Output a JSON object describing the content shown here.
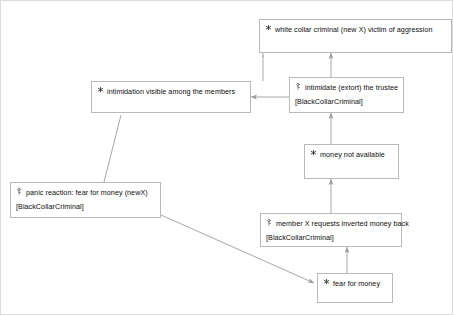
{
  "diagram": {
    "background_color": "#ffffff",
    "node_border_color": "#b9b9b9",
    "edge_color": "#a8a8a8",
    "nodes": [
      {
        "id": "victim",
        "icon": "agent-asterisk-icon",
        "label": "white collar criminal (new X) victim of aggression",
        "sub": ""
      },
      {
        "id": "intimidation-visible",
        "icon": "agent-asterisk-icon",
        "label": "intimidation visible among the members",
        "sub": ""
      },
      {
        "id": "intimidate-extort",
        "icon": "task-key-icon",
        "label": "intimidate (extort) the trustee",
        "sub": "[BlackCollarCriminal]"
      },
      {
        "id": "money-not-available",
        "icon": "agent-asterisk-icon",
        "label": "money not available",
        "sub": ""
      },
      {
        "id": "panic-reaction",
        "icon": "task-key-icon",
        "label": "panic reaction: fear for money (newX)",
        "sub": "[BlackCollarCriminal]"
      },
      {
        "id": "member-requests",
        "icon": "task-key-icon",
        "label": "member X requests inverted money back",
        "sub": "[BlackCollarCriminal]"
      },
      {
        "id": "fear-for-money",
        "icon": "agent-asterisk-icon",
        "label": "fear for money",
        "sub": ""
      }
    ],
    "edges": [
      {
        "from": "intimidate-extort",
        "to": "victim",
        "kind": "arrow-up"
      },
      {
        "from": "intimidation-visible",
        "to": "victim",
        "kind": "arrow-diagonal"
      },
      {
        "from": "intimidate-extort",
        "to": "intimidation-visible",
        "kind": "arrow-left"
      },
      {
        "from": "money-not-available",
        "to": "intimidate-extort",
        "kind": "arrow-up"
      },
      {
        "from": "member-requests",
        "to": "money-not-available",
        "kind": "arrow-up"
      },
      {
        "from": "fear-for-money",
        "to": "member-requests",
        "kind": "arrow-up"
      },
      {
        "from": "panic-reaction",
        "to": "intimidation-visible",
        "kind": "arrow-diagonal"
      },
      {
        "from": "panic-reaction",
        "to": "fear-for-money",
        "kind": "arrow-diagonal"
      }
    ]
  }
}
